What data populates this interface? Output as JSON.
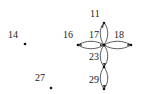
{
  "diagram": {
    "type": "directed-graph",
    "nodes": [
      {
        "id": "14",
        "label": "14",
        "x": 25,
        "y": 44,
        "lx": 8,
        "ly": 34
      },
      {
        "id": "27",
        "label": "27",
        "x": 51,
        "y": 88,
        "lx": 35,
        "ly": 76
      },
      {
        "id": "16",
        "label": "16",
        "x": 78,
        "y": 45,
        "lx": 63,
        "ly": 32
      },
      {
        "id": "17",
        "label": "17",
        "x": 104,
        "y": 45,
        "lx": 88,
        "ly": 32
      },
      {
        "id": "18",
        "label": "18",
        "x": 131,
        "y": 45,
        "lx": 115,
        "ly": 32
      },
      {
        "id": "11",
        "label": "11",
        "x": 104,
        "y": 23,
        "lx": 90,
        "ly": 11
      },
      {
        "id": "23",
        "label": "23",
        "x": 104,
        "y": 67,
        "lx": 88,
        "ly": 53
      },
      {
        "id": "29",
        "label": "29",
        "x": 104,
        "y": 89,
        "lx": 88,
        "ly": 75
      }
    ],
    "edges": [
      {
        "from": "17",
        "to": "11",
        "bidirectional": true
      },
      {
        "from": "17",
        "to": "16",
        "bidirectional": true
      },
      {
        "from": "17",
        "to": "18",
        "bidirectional": true
      },
      {
        "from": "17",
        "to": "23",
        "bidirectional": true
      },
      {
        "from": "23",
        "to": "29",
        "bidirectional": true
      }
    ],
    "colors": {
      "line": "#333333",
      "node": "#111111",
      "text": "#222222"
    }
  },
  "labels": {
    "n14": "14",
    "n27": "27",
    "n16": "16",
    "n17": "17",
    "n18": "18",
    "n11": "11",
    "n23": "23",
    "n29": "29"
  }
}
